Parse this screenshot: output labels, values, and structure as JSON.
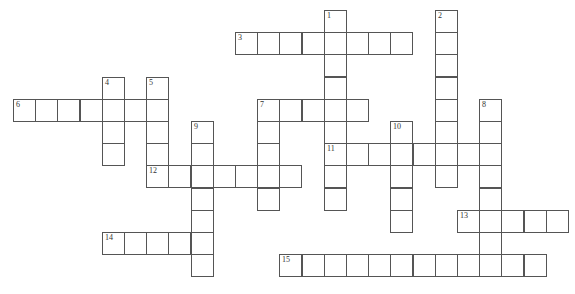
{
  "puzzle": {
    "cell_size": 22.2,
    "origin_x": 13,
    "origin_y": 10,
    "entries": [
      {
        "number": "1",
        "dir": "down",
        "col": 14,
        "row": 0,
        "length": 9
      },
      {
        "number": "2",
        "dir": "down",
        "col": 19,
        "row": 0,
        "length": 8
      },
      {
        "number": "3",
        "dir": "across",
        "col": 10,
        "row": 1,
        "length": 8
      },
      {
        "number": "4",
        "dir": "down",
        "col": 4,
        "row": 3,
        "length": 4
      },
      {
        "number": "5",
        "dir": "down",
        "col": 6,
        "row": 3,
        "length": 5
      },
      {
        "number": "6",
        "dir": "across",
        "col": 0,
        "row": 4,
        "length": 7
      },
      {
        "number": "7",
        "dir": "across",
        "col": 11,
        "row": 4,
        "length": 5
      },
      {
        "number": "7",
        "dir": "down",
        "col": 11,
        "row": 4,
        "length": 5
      },
      {
        "number": "8",
        "dir": "down",
        "col": 21,
        "row": 4,
        "length": 8
      },
      {
        "number": "9",
        "dir": "down",
        "col": 8,
        "row": 5,
        "length": 7
      },
      {
        "number": "10",
        "dir": "down",
        "col": 17,
        "row": 5,
        "length": 5
      },
      {
        "number": "11",
        "dir": "across",
        "col": 14,
        "row": 6,
        "length": 8
      },
      {
        "number": "12",
        "dir": "across",
        "col": 6,
        "row": 7,
        "length": 7
      },
      {
        "number": "13",
        "dir": "across",
        "col": 20,
        "row": 9,
        "length": 5
      },
      {
        "number": "14",
        "dir": "across",
        "col": 4,
        "row": 10,
        "length": 5
      },
      {
        "number": "15",
        "dir": "across",
        "col": 12,
        "row": 11,
        "length": 12
      }
    ]
  }
}
